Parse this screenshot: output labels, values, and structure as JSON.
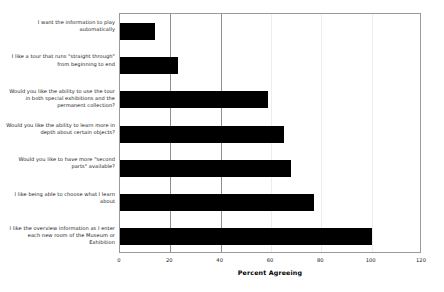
{
  "chart_data": {
    "type": "bar",
    "orientation": "horizontal",
    "title": "",
    "xlabel": "Percent Agreeing",
    "ylabel": "",
    "xlim": [
      0,
      120
    ],
    "xticks": [
      0,
      20,
      40,
      60,
      80,
      100,
      120
    ],
    "grid": true,
    "legend": null,
    "bar_color": "#000000",
    "categories": [
      "I want the information to play automatically",
      "I like a tour that runs \"straight through\" from beginning to end",
      "Would you like the ability to use the tour in both special exhibitions and the permanent collection?",
      "Would you like the ability to learn more in depth about certain objects?",
      "Would you like to have more \"second parts\" available?",
      "I like being able to choose what I learn about",
      "I like the overview information as I enter each new room of the Museum or Exhibition"
    ],
    "values": [
      14,
      23,
      59,
      65,
      68,
      77,
      100
    ]
  }
}
